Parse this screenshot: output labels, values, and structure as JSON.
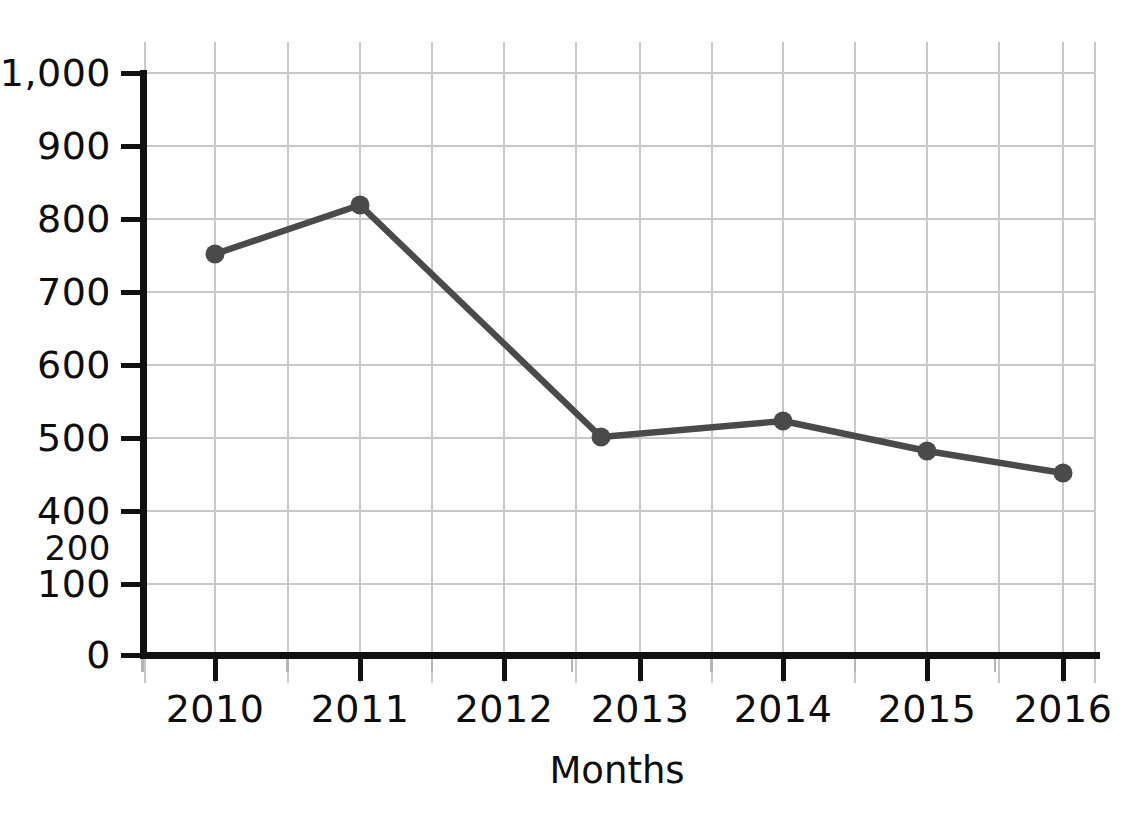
{
  "chart_data": {
    "type": "line",
    "title": "",
    "xlabel": "Months",
    "ylabel": "",
    "categories": [
      "2010",
      "2011",
      "2012",
      "2013",
      "2014",
      "2015",
      "2016"
    ],
    "series": [
      {
        "name": "series-1",
        "values": [
          750,
          820,
          null,
          500,
          520,
          480,
          450
        ]
      }
    ],
    "points": [
      {
        "x_label": "2010",
        "value": 750
      },
      {
        "x_label": "2011",
        "value": 820
      },
      {
        "x_label": "2013",
        "value": 500
      },
      {
        "x_label": "2014",
        "value": 520
      },
      {
        "x_label": "2015",
        "value": 480
      },
      {
        "x_label": "2016",
        "value": 450
      }
    ],
    "y_tick_labels": [
      "1,000",
      "900",
      "800",
      "700",
      "600",
      "500",
      "400",
      "200",
      "100",
      "0"
    ],
    "x_tick_labels": [
      "2010",
      "2011",
      "2012",
      "2013",
      "2014",
      "2015",
      "2016"
    ],
    "ylim": [
      0,
      1000
    ],
    "grid": true,
    "legend": "none",
    "line_color": "#4a4a4a",
    "marker_color": "#4a4a4a",
    "grid_color": "#c9c9c9",
    "axis_color": "#111111"
  },
  "y_axis": {
    "ticks": [
      {
        "label": "1,000",
        "y": 73,
        "has_tick": true,
        "small": false
      },
      {
        "label": "900",
        "y": 146,
        "has_tick": true,
        "small": false
      },
      {
        "label": "800",
        "y": 219,
        "has_tick": true,
        "small": false
      },
      {
        "label": "700",
        "y": 292,
        "has_tick": true,
        "small": false
      },
      {
        "label": "600",
        "y": 365,
        "has_tick": true,
        "small": false
      },
      {
        "label": "500",
        "y": 438,
        "has_tick": true,
        "small": false
      },
      {
        "label": "400",
        "y": 511,
        "has_tick": true,
        "small": false
      },
      {
        "label": "200",
        "y": 548,
        "has_tick": false,
        "small": true
      },
      {
        "label": "100",
        "y": 584,
        "has_tick": true,
        "small": false
      },
      {
        "label": "0",
        "y": 655,
        "has_tick": true,
        "small": false
      }
    ]
  },
  "x_axis": {
    "title": "Months",
    "ticks": [
      {
        "label": "2010",
        "x": 215
      },
      {
        "label": "2011",
        "x": 360
      },
      {
        "label": "2012",
        "x": 504
      },
      {
        "label": "2013",
        "x": 640
      },
      {
        "label": "2014",
        "x": 783
      },
      {
        "label": "2015",
        "x": 927
      },
      {
        "label": "2016",
        "x": 1063
      }
    ]
  },
  "plot_geometry": {
    "markers": [
      {
        "cx": 215,
        "cy": 254,
        "label": "2010",
        "value": 750
      },
      {
        "cx": 360,
        "cy": 205,
        "label": "2011",
        "value": 820
      },
      {
        "cx": 601,
        "cy": 437,
        "label": "2013",
        "value": 500
      },
      {
        "cx": 783,
        "cy": 421,
        "label": "2014",
        "value": 520
      },
      {
        "cx": 927,
        "cy": 451,
        "label": "2015",
        "value": 480
      },
      {
        "cx": 1063,
        "cy": 473,
        "label": "2016",
        "value": 450
      }
    ],
    "path": "M 215 254 L 360 205 L 601 437 L 783 421 L 927 451 L 1063 473",
    "marker_radius": 9.5,
    "h_gridlines": [
      73,
      146,
      219,
      292,
      365,
      438,
      511,
      584,
      655
    ],
    "v_gridlines": [
      145,
      215,
      288,
      360,
      432,
      504,
      576,
      640,
      712,
      783,
      855,
      927,
      999,
      1063,
      1095
    ],
    "v_grid_top": 42,
    "v_grid_bottom": 683,
    "h_grid_left": 143,
    "h_grid_right": 1095,
    "y_axis_x": 143,
    "x_axis_y": 655,
    "x_axis_left": 140,
    "x_axis_right": 1100,
    "y_axis_top": 70,
    "y_axis_bottom": 658
  }
}
